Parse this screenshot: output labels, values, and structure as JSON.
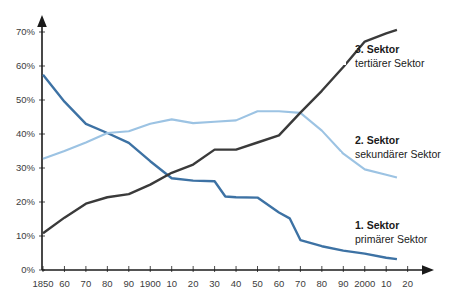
{
  "chart_data": {
    "type": "line",
    "title": "",
    "subtitle": "",
    "xlabel": "",
    "ylabel": "",
    "grid": false,
    "legend_position": "inline-right",
    "x": [
      1850,
      1860,
      1870,
      1880,
      1890,
      1900,
      1910,
      1920,
      1930,
      1940,
      1950,
      1960,
      1970,
      1980,
      1990,
      2000,
      2010,
      2020
    ],
    "xtick_labels": [
      "1850",
      "60",
      "70",
      "80",
      "90",
      "1900",
      "10",
      "20",
      "30",
      "40",
      "50",
      "60",
      "70",
      "80",
      "90",
      "2000",
      "10",
      "20"
    ],
    "ytick_labels": [
      "0%",
      "10%",
      "20%",
      "30%",
      "40%",
      "50%",
      "60%",
      "70%"
    ],
    "ytick_values": [
      0,
      10,
      20,
      30,
      40,
      50,
      60,
      70
    ],
    "ylim": [
      0,
      73
    ],
    "xlim": [
      1850,
      2020
    ],
    "series": [
      {
        "name": "1. Sektor",
        "subtitle": "primärer Sektor",
        "color": "#3d72a4",
        "x": [
          1850,
          1860,
          1870,
          1880,
          1890,
          1900,
          1910,
          1920,
          1930,
          1935,
          1940,
          1950,
          1960,
          1965,
          1970,
          1980,
          1990,
          2000,
          2010,
          2015
        ],
        "values": [
          57.4,
          49.5,
          43.0,
          40.3,
          37.4,
          32.0,
          27.0,
          26.3,
          26.1,
          21.6,
          21.4,
          21.3,
          16.9,
          15.2,
          8.8,
          7.0,
          5.7,
          4.8,
          3.6,
          3.2
        ]
      },
      {
        "name": "2. Sektor",
        "subtitle": "sekundärer Sektor",
        "color": "#9cc3e3",
        "x": [
          1850,
          1860,
          1870,
          1880,
          1890,
          1900,
          1910,
          1920,
          1930,
          1940,
          1950,
          1960,
          1970,
          1980,
          1990,
          2000,
          2010,
          2015
        ],
        "values": [
          32.7,
          35.0,
          37.5,
          40.3,
          40.8,
          43.0,
          44.3,
          43.2,
          43.6,
          44.0,
          46.7,
          46.7,
          46.2,
          41.0,
          34.2,
          29.6,
          28.0,
          27.2
        ]
      },
      {
        "name": "3. Sektor",
        "subtitle": "tertiärer Sektor",
        "color": "#3a3a3a",
        "x": [
          1850,
          1860,
          1870,
          1880,
          1890,
          1900,
          1910,
          1920,
          1930,
          1940,
          1950,
          1960,
          1970,
          1980,
          1990,
          2000,
          2010,
          2015
        ],
        "values": [
          10.8,
          15.4,
          19.5,
          21.4,
          22.3,
          25.1,
          28.6,
          31.0,
          35.4,
          35.4,
          37.5,
          39.6,
          46.3,
          52.7,
          59.7,
          67.2,
          69.6,
          70.6
        ]
      }
    ]
  },
  "legend": {
    "sector3": {
      "title": "3. Sektor",
      "sub": "tertiärer Sektor"
    },
    "sector2": {
      "title": "2. Sektor",
      "sub": "sekundärer Sektor"
    },
    "sector1": {
      "title": "1. Sektor",
      "sub": "primärer Sektor"
    }
  }
}
